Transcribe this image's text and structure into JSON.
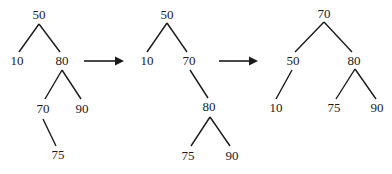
{
  "diagram": {
    "colors": {
      "ink": "#1a1a1a",
      "background": "#ffffff"
    },
    "trees": [
      {
        "id": "tree1",
        "nodes": [
          {
            "id": "t1n50",
            "label": "50",
            "x": 39,
            "y": 16
          },
          {
            "id": "t1n10",
            "label": "10",
            "x": 17,
            "y": 62
          },
          {
            "id": "t1n80",
            "label": "80",
            "x": 62,
            "y": 62
          },
          {
            "id": "t1n70",
            "label": "70",
            "x": 43,
            "y": 110
          },
          {
            "id": "t1n90",
            "label": "90",
            "x": 82,
            "y": 110
          },
          {
            "id": "t1n75",
            "label": "75",
            "x": 58,
            "y": 156
          }
        ],
        "edges": [
          {
            "from": "50",
            "to": "10",
            "x1": 39,
            "y1": 24,
            "x2": 19,
            "y2": 52
          },
          {
            "from": "50",
            "to": "80",
            "x1": 39,
            "y1": 24,
            "x2": 60,
            "y2": 52
          },
          {
            "from": "80",
            "to": "70",
            "x1": 62,
            "y1": 70,
            "x2": 45,
            "y2": 99
          },
          {
            "from": "80",
            "to": "90",
            "x1": 62,
            "y1": 70,
            "x2": 81,
            "y2": 99
          },
          {
            "from": "70",
            "to": "75",
            "x1": 43,
            "y1": 119,
            "x2": 56,
            "y2": 146
          }
        ]
      },
      {
        "id": "tree2",
        "nodes": [
          {
            "id": "t2n50",
            "label": "50",
            "x": 167,
            "y": 16
          },
          {
            "id": "t2n10",
            "label": "10",
            "x": 147,
            "y": 62
          },
          {
            "id": "t2n70",
            "label": "70",
            "x": 189,
            "y": 62
          },
          {
            "id": "t2n80",
            "label": "80",
            "x": 209,
            "y": 108
          },
          {
            "id": "t2n75",
            "label": "75",
            "x": 188,
            "y": 157
          },
          {
            "id": "t2n90",
            "label": "90",
            "x": 232,
            "y": 157
          }
        ],
        "edges": [
          {
            "from": "50",
            "to": "10",
            "x1": 167,
            "y1": 23,
            "x2": 147,
            "y2": 52
          },
          {
            "from": "50",
            "to": "70",
            "x1": 167,
            "y1": 23,
            "x2": 187,
            "y2": 52
          },
          {
            "from": "70",
            "to": "80",
            "x1": 190,
            "y1": 70,
            "x2": 208,
            "y2": 98
          },
          {
            "from": "80",
            "to": "75",
            "x1": 210,
            "y1": 117,
            "x2": 191,
            "y2": 146
          },
          {
            "from": "80",
            "to": "90",
            "x1": 210,
            "y1": 117,
            "x2": 230,
            "y2": 146
          }
        ]
      },
      {
        "id": "tree3",
        "nodes": [
          {
            "id": "t3n70",
            "label": "70",
            "x": 324,
            "y": 15
          },
          {
            "id": "t3n50",
            "label": "50",
            "x": 293,
            "y": 62
          },
          {
            "id": "t3n80",
            "label": "80",
            "x": 354,
            "y": 62
          },
          {
            "id": "t3n10",
            "label": "10",
            "x": 276,
            "y": 109
          },
          {
            "id": "t3n75",
            "label": "75",
            "x": 334,
            "y": 109
          },
          {
            "id": "t3n90",
            "label": "90",
            "x": 377,
            "y": 109
          }
        ],
        "edges": [
          {
            "from": "70",
            "to": "50",
            "x1": 324,
            "y1": 22,
            "x2": 295,
            "y2": 52
          },
          {
            "from": "70",
            "to": "80",
            "x1": 324,
            "y1": 22,
            "x2": 352,
            "y2": 52
          },
          {
            "from": "50",
            "to": "10",
            "x1": 292,
            "y1": 70,
            "x2": 276,
            "y2": 99
          },
          {
            "from": "80",
            "to": "75",
            "x1": 355,
            "y1": 69,
            "x2": 336,
            "y2": 99
          },
          {
            "from": "80",
            "to": "90",
            "x1": 355,
            "y1": 69,
            "x2": 376,
            "y2": 99
          }
        ]
      }
    ],
    "arrows": [
      {
        "id": "arrow1",
        "x1": 84,
        "y1": 61,
        "x2": 124,
        "y2": 61
      },
      {
        "id": "arrow2",
        "x1": 219,
        "y1": 61,
        "x2": 258,
        "y2": 61
      }
    ]
  }
}
